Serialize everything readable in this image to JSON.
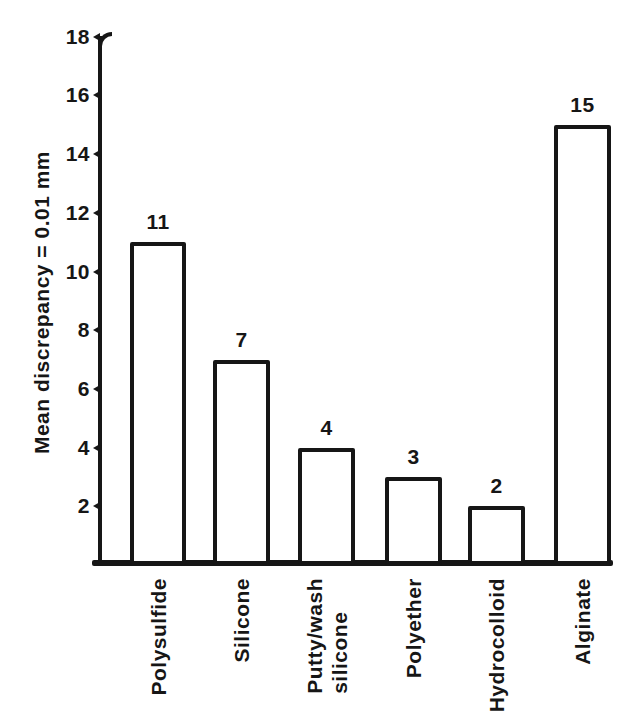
{
  "chart_data": {
    "type": "bar",
    "title": "",
    "xlabel": "",
    "ylabel": "Mean discrepancy = 0.01 mm",
    "categories": [
      "Polysulfide",
      "Silicone",
      "Putty/wash\nsilicone",
      "Polyether",
      "Hydrocolloid",
      "Alginate"
    ],
    "values": [
      11,
      7,
      4,
      3,
      2,
      15
    ],
    "bar_labels": [
      "11",
      "7",
      "4",
      "3",
      "2",
      "15"
    ],
    "yticks": [
      2,
      4,
      6,
      8,
      10,
      12,
      14,
      16,
      18
    ],
    "ylim": [
      0,
      18
    ],
    "grid": false,
    "legend": false,
    "bar_fill": "#ffffff",
    "line_color": "#161616",
    "background": "#ffffff"
  }
}
